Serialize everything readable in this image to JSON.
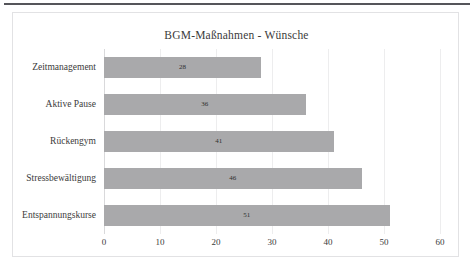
{
  "chart_data": {
    "type": "bar",
    "orientation": "horizontal",
    "title": "BGM-Maßnahmen - Wünsche",
    "xlabel": "",
    "ylabel": "",
    "categories": [
      "Zeitmanagement",
      "Aktive Pause",
      "Rückengym",
      "Stressbewältigung",
      "Entspannungskurse"
    ],
    "values": [
      28,
      36,
      41,
      46,
      51
    ],
    "data_labels": [
      "28",
      "36",
      "41",
      "46",
      "51"
    ],
    "xlim": [
      0,
      60
    ],
    "xticks": [
      0,
      10,
      20,
      30,
      40,
      50,
      60
    ],
    "xtick_labels": [
      "0",
      "10",
      "20",
      "30",
      "40",
      "50",
      "60"
    ],
    "grid": true,
    "legend": false,
    "bar_color": "#a9a9ab",
    "plot_background": "#ffffff",
    "gridline_color": "#ededee",
    "text_color": "#3b3b3b"
  }
}
